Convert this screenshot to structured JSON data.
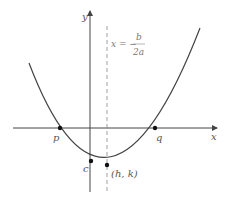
{
  "diagram": {
    "type": "parabola",
    "axes": {
      "x_label": "x",
      "y_label": "y"
    },
    "axis_of_symmetry": {
      "lhs": "x = −",
      "numerator": "b",
      "denominator": "2a"
    },
    "points": {
      "p": "p",
      "q": "q",
      "c": "c",
      "vertex": "(h, k)"
    },
    "colors": {
      "curve": "#444444",
      "axis": "#444444",
      "dashed": "#888888"
    }
  }
}
